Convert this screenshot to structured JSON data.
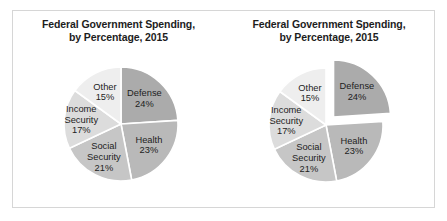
{
  "figure": {
    "background_color": "#ffffff",
    "panel_border_color": "#d6d6d6"
  },
  "charts": [
    {
      "name": "pie-chart-standard",
      "title_line1": "Federal Government Spending,",
      "title_line2": "by Percentage, 2015",
      "exploded": false
    },
    {
      "name": "pie-chart-exploded",
      "title_line1": "Federal Government Spending,",
      "title_line2": "by Percentage, 2015",
      "exploded": true
    }
  ],
  "chart_data": [
    {
      "type": "pie",
      "title": "Federal Government Spending, by Percentage, 2015",
      "subtitle": "",
      "xlabel": "",
      "ylabel": "",
      "legend": "none",
      "labels_inside_slices": true,
      "start_angle_deg": 0,
      "direction": "clockwise",
      "exploded_slices": [],
      "categories": [
        "Defense",
        "Health",
        "Social Security",
        "Income Security",
        "Other"
      ],
      "values": [
        24,
        23,
        21,
        17,
        15
      ],
      "value_labels": [
        "24%",
        "23%",
        "21%",
        "17%",
        "15%"
      ],
      "colors": [
        "#ababab",
        "#b9b9b9",
        "#c6c6c6",
        "#dcdcdc",
        "#eeeeee"
      ],
      "slice_border_color": "#ffffff",
      "total": 100,
      "units": "percent"
    },
    {
      "type": "pie",
      "title": "Federal Government Spending, by Percentage, 2015",
      "subtitle": "",
      "xlabel": "",
      "ylabel": "",
      "legend": "none",
      "labels_inside_slices": true,
      "start_angle_deg": 0,
      "direction": "clockwise",
      "exploded_slices": [
        "Defense"
      ],
      "categories": [
        "Defense",
        "Health",
        "Social Security",
        "Income Security",
        "Other"
      ],
      "values": [
        24,
        23,
        21,
        17,
        15
      ],
      "value_labels": [
        "24%",
        "23%",
        "21%",
        "17%",
        "15%"
      ],
      "colors": [
        "#ababab",
        "#b9b9b9",
        "#c6c6c6",
        "#dcdcdc",
        "#eeeeee"
      ],
      "slice_border_color": "#ffffff",
      "total": 100,
      "units": "percent"
    }
  ],
  "label_layout": {
    "Defense": {
      "lines": [
        "Defense"
      ],
      "radius_factor": 0.6
    },
    "Health": {
      "lines": [
        "Health"
      ],
      "radius_factor": 0.62
    },
    "Social Security": {
      "lines": [
        "Social",
        "Security"
      ],
      "radius_factor": 0.66
    },
    "Income Security": {
      "lines": [
        "Income",
        "Security"
      ],
      "radius_factor": 0.7
    },
    "Other": {
      "lines": [
        "Other"
      ],
      "radius_factor": 0.62
    }
  }
}
